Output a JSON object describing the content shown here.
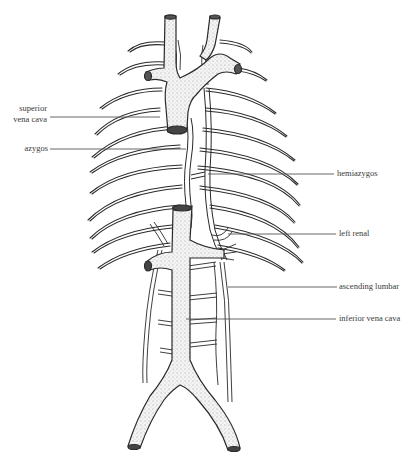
{
  "figure": {
    "colors": {
      "ink": "#2a2a2a",
      "background": "#ffffff",
      "leader": "#555555"
    },
    "labels": {
      "superior_vena_cava_line1": "superior",
      "superior_vena_cava_line2": "vena cava",
      "azygos": "azygos",
      "hemiazygos": "hemiazygos",
      "left_renal": "left renal",
      "ascending_lumbar": "ascending lumbar",
      "inferior_vena_cava": "inferior vena cava"
    }
  }
}
